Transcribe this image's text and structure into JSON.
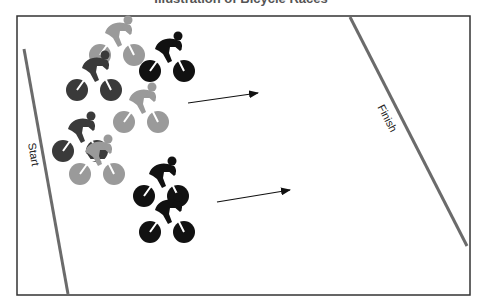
{
  "figure": {
    "title": "Illustration of Bicycle Races",
    "frame": {
      "x": 17,
      "y": 16,
      "width": 453,
      "height": 279,
      "stroke": "#333333"
    },
    "start_line": {
      "label": "Start",
      "x1": 24,
      "y1": 49,
      "x2": 68,
      "y2": 294,
      "color": "#6b6b6b",
      "label_x": 30,
      "label_y": 155,
      "label_rotate": 80
    },
    "finish_line": {
      "label": "Finish",
      "x1": 350,
      "y1": 17,
      "x2": 467,
      "y2": 246,
      "color": "#6b6b6b",
      "label_x": 384,
      "label_y": 120,
      "label_rotate": 63
    },
    "arrows": [
      {
        "x1": 188,
        "y1": 103,
        "x2": 258,
        "y2": 93
      },
      {
        "x1": 217,
        "y1": 202,
        "x2": 290,
        "y2": 190
      }
    ],
    "colors": {
      "black": "#111111",
      "dark": "#3a3a3a",
      "light": "#9a9a9a"
    },
    "cyclists": [
      {
        "id": "A",
        "shade": "light",
        "x": 100,
        "y": 55
      },
      {
        "id": "B",
        "shade": "black",
        "x": 150,
        "y": 71
      },
      {
        "id": "C",
        "shade": "dark",
        "x": 77,
        "y": 90
      },
      {
        "id": "D",
        "shade": "light",
        "x": 124,
        "y": 122
      },
      {
        "id": "E",
        "shade": "dark",
        "x": 63,
        "y": 151
      },
      {
        "id": "F",
        "shade": "light",
        "x": 80,
        "y": 174
      },
      {
        "id": "G",
        "shade": "black",
        "x": 144,
        "y": 196
      },
      {
        "id": "H",
        "shade": "black",
        "x": 150,
        "y": 232
      }
    ]
  }
}
